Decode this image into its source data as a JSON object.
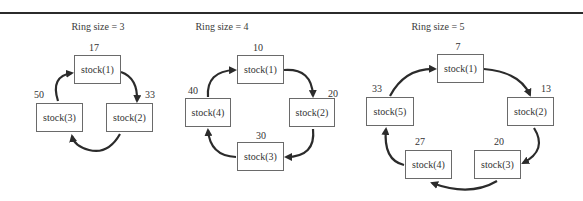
{
  "diagrams": [
    {
      "title": "Ring size = 3",
      "nodes": [
        {
          "label": "stock(1)",
          "value": "17"
        },
        {
          "label": "stock(2)",
          "value": "33"
        },
        {
          "label": "stock(3)",
          "value": "50"
        }
      ]
    },
    {
      "title": "Ring size = 4",
      "nodes": [
        {
          "label": "stock(1)",
          "value": "10"
        },
        {
          "label": "stock(2)",
          "value": "20"
        },
        {
          "label": "stock(3)",
          "value": "30"
        },
        {
          "label": "stock(4)",
          "value": "40"
        }
      ]
    },
    {
      "title": "Ring size = 5",
      "nodes": [
        {
          "label": "stock(1)",
          "value": "7"
        },
        {
          "label": "stock(2)",
          "value": "13"
        },
        {
          "label": "stock(3)",
          "value": "20"
        },
        {
          "label": "stock(4)",
          "value": "27"
        },
        {
          "label": "stock(5)",
          "value": "33"
        }
      ]
    }
  ],
  "colors": {
    "arrow": "#2b2b2b",
    "box_border": "#6a6a6a",
    "rule": "#2b2b2b"
  }
}
